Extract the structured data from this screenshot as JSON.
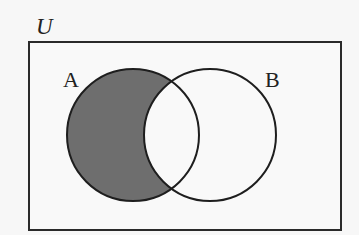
{
  "diagram": {
    "type": "venn",
    "title": "",
    "universe": {
      "label": "U",
      "rect": {
        "x": 29,
        "y": 42,
        "width": 312,
        "height": 188
      },
      "stroke": "#2a2a2a",
      "fill": "#f9f9f9"
    },
    "sets": [
      {
        "label": "A",
        "cx": 133,
        "cy": 135,
        "r": 66,
        "label_x": 63,
        "label_y": 87
      },
      {
        "label": "B",
        "cx": 210,
        "cy": 135,
        "r": 66,
        "label_x": 265,
        "label_y": 87
      }
    ],
    "shaded_region": {
      "description": "A minus B (A ∩ B')",
      "color": "#6e6e6e"
    },
    "colors": {
      "stroke": "#1e1e1e",
      "background": "#f7f7f7"
    }
  }
}
